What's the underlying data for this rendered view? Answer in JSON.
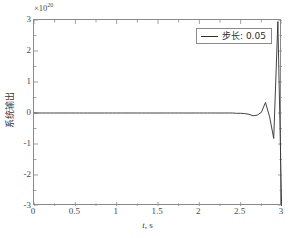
{
  "chart_data": {
    "type": "line",
    "title": "",
    "xlabel": "t, s",
    "ylabel": "系统输出",
    "exponent_mantissa": "×10",
    "exponent_power": "20",
    "y_scale_note": "×10^20",
    "xlim": [
      0,
      3
    ],
    "ylim": [
      -3,
      3
    ],
    "xticks": [
      "0",
      "0.5",
      "1",
      "1.5",
      "2",
      "2.5",
      "3"
    ],
    "xtick_values": [
      0,
      0.5,
      1,
      1.5,
      2,
      2.5,
      3
    ],
    "yticks": [
      "3",
      "2",
      "1",
      "0",
      "-1",
      "-2",
      "-3"
    ],
    "ytick_values": [
      3,
      2,
      1,
      0,
      -1,
      -2,
      -3
    ],
    "grid": false,
    "legend_position": "top-right",
    "line_color": "#2e2e2e",
    "axis_color": "#8a8a8a",
    "series": [
      {
        "name": "步长: 0.05",
        "color": "#2e2e2e",
        "x": [
          0.0,
          0.05,
          0.1,
          0.15,
          0.2,
          0.25,
          0.3,
          0.35,
          0.4,
          0.45,
          0.5,
          0.55,
          0.6,
          0.65,
          0.7,
          0.75,
          0.8,
          0.85,
          0.9,
          0.95,
          1.0,
          1.05,
          1.1,
          1.15,
          1.2,
          1.25,
          1.3,
          1.35,
          1.4,
          1.45,
          1.5,
          1.55,
          1.6,
          1.65,
          1.7,
          1.75,
          1.8,
          1.85,
          1.9,
          1.95,
          2.0,
          2.05,
          2.1,
          2.15,
          2.2,
          2.25,
          2.3,
          2.35,
          2.4,
          2.45,
          2.5,
          2.55,
          2.6,
          2.65,
          2.7,
          2.75,
          2.8,
          2.85,
          2.9,
          2.95,
          3.0
        ],
        "y": [
          0.0,
          0.0,
          0.0,
          0.0,
          0.0,
          0.0,
          0.0,
          0.0,
          0.0,
          0.0,
          0.0,
          0.0,
          0.0,
          0.0,
          0.0,
          0.0,
          0.0,
          0.0,
          0.0,
          0.0,
          0.0,
          0.0,
          0.0,
          0.0,
          0.0,
          0.0,
          0.0,
          0.0,
          0.0,
          0.0,
          0.0,
          0.0,
          0.0,
          0.0,
          0.0,
          0.0,
          0.0,
          0.0,
          0.0,
          0.0,
          0.0,
          0.0,
          0.0,
          0.0,
          0.0,
          0.0,
          0.0,
          0.0,
          0.0,
          -0.01,
          -0.01,
          -0.02,
          -0.04,
          -0.09,
          -0.07,
          0.02,
          0.34,
          -0.12,
          -0.82,
          2.95,
          -3.6
        ]
      }
    ],
    "annotations": []
  },
  "legend": {
    "entries": [
      {
        "label": "步长: 0.05",
        "swatch": "line-swatch"
      }
    ]
  },
  "axes": {
    "x_title": "t, s",
    "x_title_var": "t",
    "x_title_unit": ", s",
    "y_title": "系统输出"
  }
}
